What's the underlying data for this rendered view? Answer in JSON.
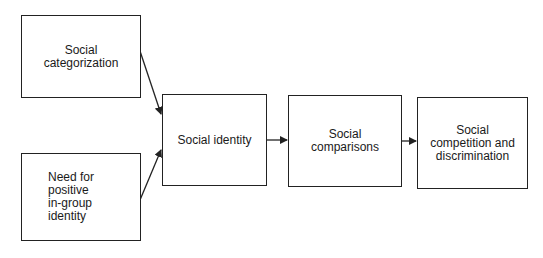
{
  "diagram": {
    "type": "flowchart",
    "nodes": [
      {
        "id": "social_categorization",
        "label": "Social\ncategorization"
      },
      {
        "id": "need_positive_identity",
        "label": "Need for\npositive\nin-group\nidentity"
      },
      {
        "id": "social_identity",
        "label": "Social identity"
      },
      {
        "id": "social_comparisons",
        "label": "Social\ncomparisons"
      },
      {
        "id": "social_competition",
        "label": "Social\ncompetition and\ndiscrimination"
      }
    ],
    "edges": [
      {
        "from": "social_categorization",
        "to": "social_identity"
      },
      {
        "from": "need_positive_identity",
        "to": "social_identity"
      },
      {
        "from": "social_identity",
        "to": "social_comparisons"
      },
      {
        "from": "social_comparisons",
        "to": "social_competition"
      }
    ],
    "colors": {
      "stroke": "#222222",
      "background": "#ffffff",
      "text": "#1a1a1a"
    }
  }
}
